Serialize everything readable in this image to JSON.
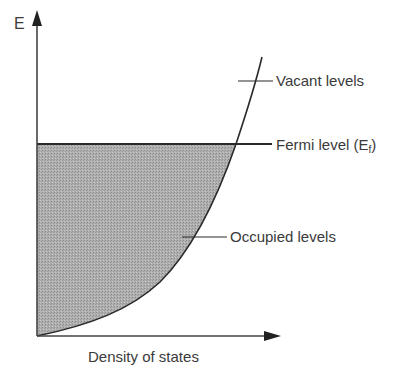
{
  "diagram": {
    "type": "density-of-states",
    "y_axis_label": "E",
    "x_axis_label": "Density of states",
    "annotations": {
      "vacant": "Vacant levels",
      "fermi": "Fermi level (E",
      "fermi_sub": "f",
      "fermi_close": ")",
      "occupied": "Occupied levels"
    },
    "colors": {
      "line": "#2a2a2a",
      "fill": "#a9a9a9",
      "text": "#3a3a3a"
    }
  }
}
